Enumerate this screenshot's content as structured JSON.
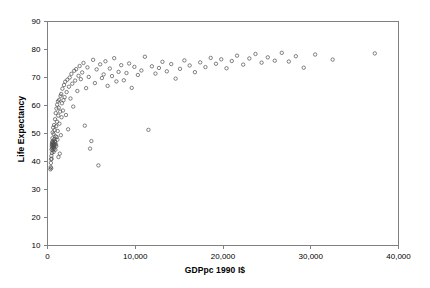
{
  "chart_data": {
    "type": "scatter",
    "title": "",
    "xlabel": "GDPpc 1990 I$",
    "ylabel": "Life Expectancy",
    "xlim": [
      0,
      40000
    ],
    "ylim": [
      10,
      90
    ],
    "xticks": [
      0,
      10000,
      20000,
      30000,
      40000
    ],
    "xticklabels": [
      "0",
      "10,000",
      "20,000",
      "30,000",
      "40,000"
    ],
    "yticks": [
      10,
      20,
      30,
      40,
      50,
      60,
      70,
      80,
      90
    ],
    "yticklabels": [
      "10",
      "20",
      "30",
      "40",
      "50",
      "60",
      "70",
      "80",
      "90"
    ],
    "grid": false,
    "legend": null,
    "marker": {
      "shape": "open-circle",
      "size": 3.4,
      "edge_color": "#4d4d4d",
      "face_color": "none",
      "edge_width": 0.7
    },
    "frame_color": "#808080",
    "series": [
      {
        "name": "Countries",
        "points": [
          [
            330,
            37.2
          ],
          [
            360,
            38.0
          ],
          [
            390,
            39.5
          ],
          [
            410,
            40.8
          ],
          [
            420,
            37.6
          ],
          [
            440,
            42.0
          ],
          [
            460,
            44.3
          ],
          [
            470,
            41.0
          ],
          [
            490,
            45.4
          ],
          [
            500,
            46.2
          ],
          [
            510,
            43.1
          ],
          [
            520,
            47.0
          ],
          [
            530,
            44.8
          ],
          [
            545,
            45.9
          ],
          [
            560,
            48.3
          ],
          [
            575,
            46.5
          ],
          [
            590,
            50.4
          ],
          [
            600,
            44.0
          ],
          [
            615,
            45.2
          ],
          [
            630,
            46.8
          ],
          [
            645,
            52.1
          ],
          [
            660,
            45.6
          ],
          [
            675,
            47.5
          ],
          [
            690,
            43.4
          ],
          [
            700,
            49.8
          ],
          [
            715,
            45.0
          ],
          [
            730,
            46.0
          ],
          [
            745,
            53.0
          ],
          [
            760,
            44.5
          ],
          [
            775,
            48.0
          ],
          [
            790,
            46.4
          ],
          [
            805,
            51.2
          ],
          [
            820,
            45.8
          ],
          [
            840,
            47.2
          ],
          [
            860,
            55.1
          ],
          [
            880,
            46.9
          ],
          [
            900,
            44.2
          ],
          [
            920,
            49.0
          ],
          [
            940,
            57.3
          ],
          [
            960,
            46.1
          ],
          [
            980,
            52.6
          ],
          [
            1000,
            45.5
          ],
          [
            1020,
            58.9
          ],
          [
            1050,
            48.7
          ],
          [
            1080,
            54.2
          ],
          [
            1100,
            60.3
          ],
          [
            1130,
            47.8
          ],
          [
            1160,
            50.9
          ],
          [
            1190,
            61.5
          ],
          [
            1220,
            56.4
          ],
          [
            1250,
            41.6
          ],
          [
            1280,
            59.2
          ],
          [
            1320,
            62.0
          ],
          [
            1360,
            53.5
          ],
          [
            1400,
            42.8
          ],
          [
            1440,
            57.8
          ],
          [
            1480,
            63.4
          ],
          [
            1520,
            49.4
          ],
          [
            1560,
            64.1
          ],
          [
            1600,
            55.8
          ],
          [
            1650,
            60.8
          ],
          [
            1700,
            66.0
          ],
          [
            1760,
            58.2
          ],
          [
            1820,
            61.9
          ],
          [
            1880,
            67.3
          ],
          [
            1950,
            63.0
          ],
          [
            2020,
            68.5
          ],
          [
            2100,
            56.6
          ],
          [
            2180,
            64.8
          ],
          [
            2260,
            69.2
          ],
          [
            2350,
            51.5
          ],
          [
            2440,
            66.7
          ],
          [
            2530,
            70.0
          ],
          [
            2620,
            62.5
          ],
          [
            2720,
            71.3
          ],
          [
            2820,
            67.8
          ],
          [
            2930,
            59.6
          ],
          [
            3040,
            72.4
          ],
          [
            3150,
            68.9
          ],
          [
            3270,
            73.0
          ],
          [
            3400,
            65.2
          ],
          [
            3530,
            70.6
          ],
          [
            3660,
            74.1
          ],
          [
            3800,
            69.4
          ],
          [
            3950,
            71.8
          ],
          [
            4100,
            75.2
          ],
          [
            4250,
            52.8
          ],
          [
            4400,
            66.2
          ],
          [
            4550,
            73.6
          ],
          [
            4700,
            70.2
          ],
          [
            4850,
            44.6
          ],
          [
            5000,
            47.3
          ],
          [
            5200,
            76.3
          ],
          [
            5400,
            68.0
          ],
          [
            5600,
            72.9
          ],
          [
            5800,
            38.6
          ],
          [
            6000,
            74.7
          ],
          [
            6200,
            69.8
          ],
          [
            6400,
            71.1
          ],
          [
            6600,
            75.8
          ],
          [
            6850,
            67.0
          ],
          [
            7100,
            73.2
          ],
          [
            7350,
            70.5
          ],
          [
            7600,
            76.9
          ],
          [
            7850,
            68.6
          ],
          [
            8100,
            72.0
          ],
          [
            8400,
            74.4
          ],
          [
            8700,
            69.0
          ],
          [
            9000,
            71.6
          ],
          [
            9300,
            75.0
          ],
          [
            9600,
            66.3
          ],
          [
            9900,
            73.8
          ],
          [
            10300,
            70.9
          ],
          [
            10700,
            72.5
          ],
          [
            11100,
            77.4
          ],
          [
            11500,
            51.3
          ],
          [
            11900,
            74.0
          ],
          [
            12300,
            71.4
          ],
          [
            12700,
            73.4
          ],
          [
            13100,
            75.6
          ],
          [
            13600,
            72.2
          ],
          [
            14100,
            74.8
          ],
          [
            14600,
            69.6
          ],
          [
            15100,
            73.1
          ],
          [
            15600,
            76.1
          ],
          [
            16200,
            74.3
          ],
          [
            16800,
            71.9
          ],
          [
            17400,
            75.4
          ],
          [
            18000,
            73.7
          ],
          [
            18600,
            77.0
          ],
          [
            19200,
            74.9
          ],
          [
            19800,
            76.5
          ],
          [
            20400,
            73.3
          ],
          [
            21000,
            75.9
          ],
          [
            21600,
            77.8
          ],
          [
            22300,
            74.6
          ],
          [
            23000,
            76.8
          ],
          [
            23700,
            78.4
          ],
          [
            24400,
            75.3
          ],
          [
            25100,
            77.2
          ],
          [
            25900,
            76.0
          ],
          [
            26700,
            78.8
          ],
          [
            27500,
            75.7
          ],
          [
            28300,
            77.6
          ],
          [
            29200,
            73.5
          ],
          [
            30500,
            78.2
          ],
          [
            32500,
            76.4
          ],
          [
            37300,
            78.6
          ]
        ]
      }
    ]
  },
  "axes": {
    "x_title": "GDPpc 1990 I$",
    "y_title": "Life Expectancy"
  }
}
